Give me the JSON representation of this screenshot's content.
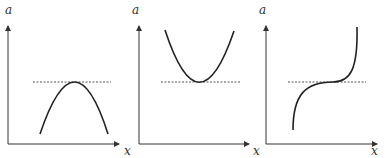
{
  "panels": [
    {
      "id": "maximum",
      "y_label": "a",
      "x_label": "x",
      "curve": "concave-down parabola with maximum touching dashed line"
    },
    {
      "id": "minimum",
      "y_label": "a",
      "x_label": "x",
      "curve": "concave-up parabola with minimum touching dashed line"
    },
    {
      "id": "inflection",
      "y_label": "a",
      "x_label": "x",
      "curve": "cubic with horizontal inflection point on dashed line"
    }
  ],
  "colors": {
    "axis": "#333333",
    "curve": "#222222",
    "dashed": "#555555"
  }
}
